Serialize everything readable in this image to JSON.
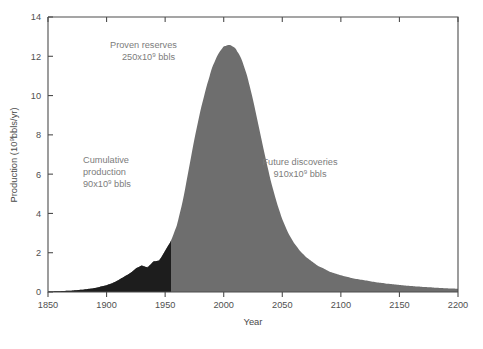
{
  "chart_data": {
    "type": "area",
    "title": "",
    "xlabel": "Year",
    "ylabel": "Production (10⁹bbls/yr)",
    "ylabel_base": "Production (10",
    "ylabel_exp": "9",
    "ylabel_tail": "bbls/yr)",
    "xlim": [
      1850,
      2200
    ],
    "ylim": [
      0,
      14
    ],
    "xticks": [
      1850,
      1900,
      1950,
      2000,
      2050,
      2100,
      2150,
      2200
    ],
    "yticks": [
      0,
      2,
      4,
      6,
      8,
      10,
      12,
      14
    ],
    "grid": false,
    "legend": "none",
    "x": [
      1850,
      1860,
      1870,
      1880,
      1890,
      1900,
      1905,
      1910,
      1915,
      1920,
      1925,
      1930,
      1935,
      1940,
      1945,
      1950,
      1955,
      1960,
      1965,
      1970,
      1975,
      1980,
      1985,
      1990,
      1995,
      2000,
      2005,
      2010,
      2015,
      2020,
      2025,
      2030,
      2035,
      2040,
      2045,
      2050,
      2055,
      2060,
      2065,
      2070,
      2080,
      2090,
      2100,
      2110,
      2120,
      2130,
      2140,
      2150,
      2160,
      2170,
      2180,
      2190,
      2200
    ],
    "values": [
      0.02,
      0.04,
      0.07,
      0.12,
      0.2,
      0.35,
      0.45,
      0.6,
      0.78,
      0.95,
      1.2,
      1.35,
      1.25,
      1.55,
      1.6,
      2.1,
      2.6,
      3.4,
      4.6,
      6.2,
      7.8,
      9.2,
      10.4,
      11.4,
      12.1,
      12.5,
      12.6,
      12.4,
      11.9,
      11.0,
      9.8,
      8.4,
      7.0,
      5.7,
      4.6,
      3.7,
      3.0,
      2.5,
      2.1,
      1.8,
      1.35,
      1.05,
      0.85,
      0.7,
      0.6,
      0.5,
      0.42,
      0.36,
      0.3,
      0.26,
      0.22,
      0.19,
      0.16
    ],
    "split_year": 1955,
    "series": [
      {
        "name": "Cumulative production",
        "color": "#1d1d1d",
        "region": "left-of-split",
        "value_label": "90x10⁹ bbls"
      },
      {
        "name": "Proven reserves + Future discoveries",
        "color": "#6e6e6e",
        "region": "right-of-split"
      }
    ],
    "annotations": [
      {
        "id": "proven-reserves",
        "line1": "Proven reserves",
        "amount_prefix": "250x10",
        "amount_exp": "9",
        "amount_suffix": " bbls",
        "x_px": 110,
        "y_px": 48,
        "color": "#7c7c7c"
      },
      {
        "id": "cumulative-production",
        "line1": "Cumulative",
        "line2": "production",
        "amount_prefix": "90x10",
        "amount_exp": "9",
        "amount_suffix": " bbls",
        "x_px": 83,
        "y_px": 163,
        "color": "#7c7c7c"
      },
      {
        "id": "future-discoveries",
        "line1": "Future discoveries",
        "amount_prefix": "910x10",
        "amount_exp": "9",
        "amount_suffix": " bbls",
        "x_px": 300,
        "y_px": 165,
        "color": "#7c7c7c"
      }
    ]
  },
  "figure": {
    "caption": "",
    "background": "#ffffff",
    "plot_area": {
      "left": 48,
      "top": 17,
      "right": 458,
      "bottom": 292
    }
  },
  "colors": {
    "gray_fill": "#6e6e6e",
    "black_fill": "#1d1d1d",
    "axis": "#4d4d4d",
    "tick_text": "#4f4f4f",
    "annotation_text": "#7c7c7c"
  }
}
